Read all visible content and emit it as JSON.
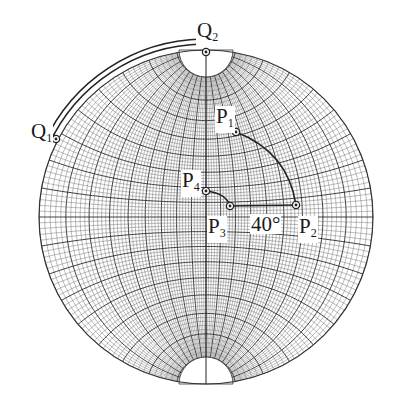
{
  "net": {
    "center": [
      206,
      217
    ],
    "radius": 167,
    "grid_major_deg": 10,
    "grid_minor_deg": 2,
    "line_color": "#2a2a2a",
    "minor_color": "#6a6a6a"
  },
  "points": [
    {
      "id": "Q1",
      "label": "Q",
      "sub": "1",
      "x": 56,
      "y": 139,
      "label_x": 30,
      "label_y": 121
    },
    {
      "id": "Q2",
      "label": "Q",
      "sub": "2",
      "x": 206,
      "y": 52,
      "label_x": 196,
      "label_y": 20
    },
    {
      "id": "P1",
      "label": "P",
      "sub": "1",
      "x": 236,
      "y": 132,
      "label_x": 215,
      "label_y": 106
    },
    {
      "id": "P2",
      "label": "P",
      "sub": "2",
      "x": 296,
      "y": 205,
      "label_x": 298,
      "label_y": 216
    },
    {
      "id": "P3",
      "label": "P",
      "sub": "3",
      "x": 230,
      "y": 206,
      "label_x": 207,
      "label_y": 216
    },
    {
      "id": "P4",
      "label": "P",
      "sub": "4",
      "x": 206,
      "y": 191,
      "label_x": 181,
      "label_y": 170
    }
  ],
  "angle_label": {
    "text": "40°",
    "x": 250,
    "y": 214
  }
}
